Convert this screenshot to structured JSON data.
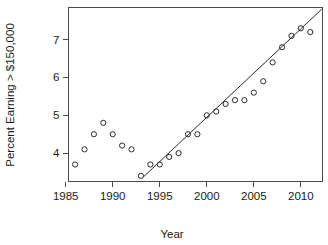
{
  "chart_data": {
    "type": "scatter",
    "title": "",
    "xlabel": "Year",
    "ylabel": "Percent Earning > $150,000",
    "xlim": [
      1985.3,
      2012.3
    ],
    "ylim": [
      3.25,
      7.85
    ],
    "grid": false,
    "legend": "none",
    "xticks": [
      1985,
      1990,
      1995,
      2000,
      2005,
      2010
    ],
    "xtick_labels": [
      "1985",
      "1990",
      "1995",
      "2000",
      "2005",
      "2010"
    ],
    "yticks": [
      4,
      5,
      6,
      7
    ],
    "ytick_labels": [
      "4",
      "5",
      "6",
      "7"
    ],
    "marker": "open-circle",
    "point_color": "#2b2b2b",
    "line_color": "#2b2b2b",
    "axis_color": "#4a4a4a",
    "x": [
      1986,
      1987,
      1988,
      1989,
      1990,
      1991,
      1992,
      1993,
      1994,
      1995,
      1996,
      1997,
      1998,
      1999,
      2000,
      2001,
      2002,
      2003,
      2004,
      2005,
      2006,
      2007,
      2008,
      2009,
      2010,
      2011
    ],
    "y": [
      3.7,
      4.1,
      4.5,
      4.8,
      4.5,
      4.2,
      4.1,
      3.4,
      3.7,
      3.7,
      3.9,
      4.0,
      4.5,
      4.5,
      5.0,
      5.1,
      5.3,
      5.4,
      5.4,
      5.6,
      5.9,
      6.4,
      6.8,
      7.1,
      7.3,
      7.2
    ],
    "points": [
      {
        "year": 1986,
        "value": 3.7
      },
      {
        "year": 1987,
        "value": 4.1
      },
      {
        "year": 1988,
        "value": 4.5
      },
      {
        "year": 1989,
        "value": 4.8
      },
      {
        "year": 1990,
        "value": 4.5
      },
      {
        "year": 1991,
        "value": 4.2
      },
      {
        "year": 1992,
        "value": 4.1
      },
      {
        "year": 1993,
        "value": 3.4
      },
      {
        "year": 1994,
        "value": 3.7
      },
      {
        "year": 1995,
        "value": 3.7
      },
      {
        "year": 1996,
        "value": 3.9
      },
      {
        "year": 1997,
        "value": 4.0
      },
      {
        "year": 1998,
        "value": 4.5
      },
      {
        "year": 1999,
        "value": 4.5
      },
      {
        "year": 2000,
        "value": 5.0
      },
      {
        "year": 2001,
        "value": 5.1
      },
      {
        "year": 2002,
        "value": 5.3
      },
      {
        "year": 2003,
        "value": 5.4
      },
      {
        "year": 2004,
        "value": 5.4
      },
      {
        "year": 2005,
        "value": 5.6
      },
      {
        "year": 2006,
        "value": 5.9
      },
      {
        "year": 2007,
        "value": 6.4
      },
      {
        "year": 2008,
        "value": 6.8
      },
      {
        "year": 2009,
        "value": 7.1
      },
      {
        "year": 2010,
        "value": 7.3
      },
      {
        "year": 2011,
        "value": 7.2
      }
    ],
    "trend_line": {
      "label": "fitted-regression-line",
      "x_start": 1993.3,
      "y_start": 3.38,
      "x_end": 2012.2,
      "y_end": 7.8
    }
  }
}
